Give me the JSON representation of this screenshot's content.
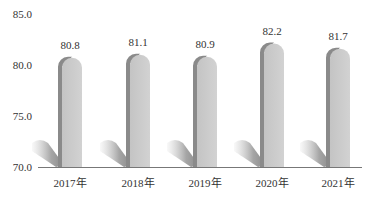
{
  "chart_data": {
    "type": "bar",
    "title": "",
    "xlabel": "",
    "ylabel": "",
    "categories": [
      "2017年",
      "2018年",
      "2019年",
      "2020年",
      "2021年"
    ],
    "values": [
      80.8,
      81.1,
      80.9,
      82.2,
      81.7
    ],
    "value_labels": [
      "80.8",
      "81.1",
      "80.9",
      "82.2",
      "81.7"
    ],
    "yticks": [
      "85.0",
      "80.0",
      "75.0",
      "70.0"
    ],
    "ylim": [
      70,
      85
    ],
    "grid": false,
    "legend": null,
    "style": "3d-rounded-cylinder-bars-with-shadow",
    "colors": {
      "bar_face": "#c8c8c8",
      "bar_side": "#8a8a8a",
      "shadow": "#9a9a9a",
      "axis": "#777777"
    }
  }
}
